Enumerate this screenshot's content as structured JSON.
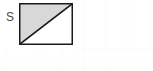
{
  "figure": {
    "label": "S",
    "label_name": "shape-label-S",
    "shape": "rectangle-with-diagonal",
    "shaded_region": "upper-left-triangle",
    "unshaded_region": "lower-right-triangle",
    "diagonal_direction": "bottom-left-to-top-right",
    "colors": {
      "shaded_fill": "#d8d8d8",
      "unshaded_fill": "#ffffff",
      "border": "#1a1a1a",
      "diagonal": "#1a1a1a",
      "label_text": "#4a4a4a",
      "background": "#ffffff",
      "grid_line": "#fbfbfb"
    },
    "geometry": {
      "rect_x": 19,
      "rect_y": 3,
      "rect_width": 54,
      "rect_height": 42,
      "border_width": 1.5,
      "diagonal_width": 1.6
    },
    "vertices": {
      "top_left": [
        0,
        0
      ],
      "top_right": [
        54,
        0
      ],
      "bottom_right": [
        54,
        42
      ],
      "bottom_left": [
        0,
        42
      ]
    }
  },
  "background": {
    "grid_vertical_x": [
      6,
      40,
      62,
      84,
      106,
      128,
      150
    ],
    "grid_horizontal_y": [
      49,
      58,
      68
    ]
  }
}
